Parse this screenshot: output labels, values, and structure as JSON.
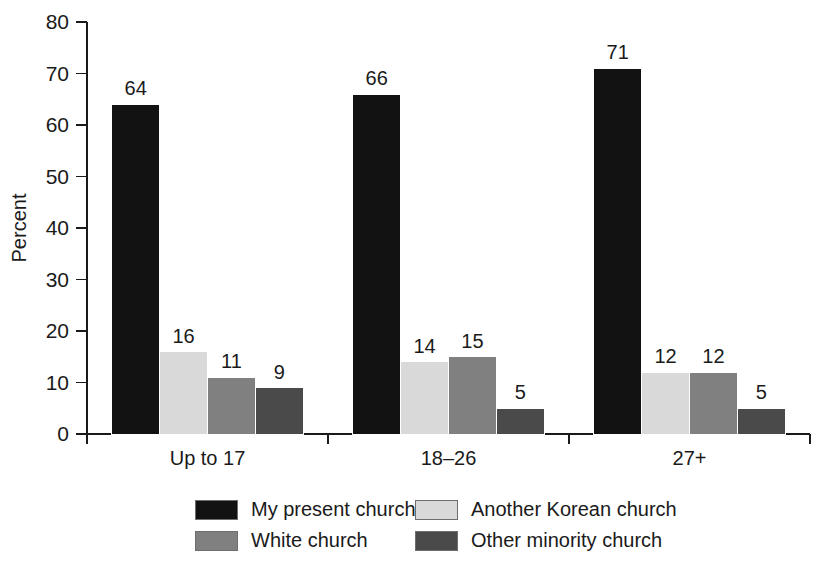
{
  "chart_data": {
    "type": "bar",
    "title": "",
    "subtitle": "",
    "xlabel": "",
    "ylabel": "Percent",
    "ylim": [
      0,
      80
    ],
    "yticks": [
      0,
      10,
      20,
      30,
      40,
      50,
      60,
      70,
      80
    ],
    "ytick_labels": [
      "0",
      "10",
      "20",
      "30",
      "40",
      "50",
      "60",
      "70",
      "80"
    ],
    "grid": false,
    "legend_position": "bottom",
    "categories": [
      "Up to 17",
      "18–26",
      "27+"
    ],
    "series": [
      {
        "name": "My present church",
        "color": "#121212",
        "values": [
          64,
          66,
          71
        ],
        "value_labels": [
          "64",
          "66",
          "71"
        ]
      },
      {
        "name": "Another Korean church",
        "color": "#d9d9d9",
        "values": [
          16,
          14,
          12
        ],
        "value_labels": [
          "16",
          "14",
          "12"
        ]
      },
      {
        "name": "White church",
        "color": "#808080",
        "values": [
          11,
          15,
          12
        ],
        "value_labels": [
          "11",
          "15",
          "12"
        ]
      },
      {
        "name": "Other minority church",
        "color": "#4a4a4a",
        "values": [
          9,
          5,
          5
        ],
        "value_labels": [
          "9",
          "5",
          "5"
        ]
      }
    ]
  },
  "legend": {
    "items": [
      {
        "label": "My present church",
        "color": "#121212"
      },
      {
        "label": "Another Korean church",
        "color": "#d9d9d9"
      },
      {
        "label": "White church",
        "color": "#808080"
      },
      {
        "label": "Other minority church",
        "color": "#4a4a4a"
      }
    ]
  }
}
